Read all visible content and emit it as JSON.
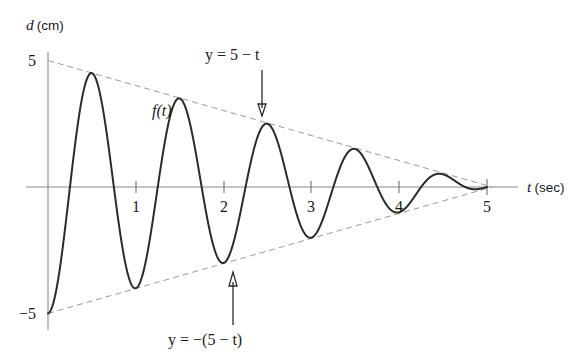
{
  "chart_data": {
    "type": "line",
    "title": "",
    "xlabel": "t (sec)",
    "ylabel": "d (cm)",
    "xlabel_symbol": "t",
    "xlabel_unit": "(sec)",
    "ylabel_symbol": "d",
    "ylabel_unit": "(cm)",
    "xlim": [
      0,
      5.35
    ],
    "ylim": [
      -5.6,
      5.4
    ],
    "grid": false,
    "legend": "none",
    "x_ticks": [
      1,
      2,
      3,
      4,
      5
    ],
    "x_tick_labels": [
      "1",
      "2",
      "3",
      "4",
      "5"
    ],
    "y_ticks": [
      5,
      -5
    ],
    "y_tick_labels": [
      "5",
      "-5"
    ],
    "series": [
      {
        "name": "f(t)",
        "label": "f(t)",
        "kind": "damped-oscillation",
        "expression": "f(t) = -(5 - t) * cos(2*pi*t)",
        "style": "solid",
        "color": "#2b2b2b",
        "domain": [
          0,
          5
        ],
        "period": 1,
        "points": [
          {
            "t": 0.0,
            "d": 5.0
          },
          {
            "t": 0.5,
            "d": -4.65
          },
          {
            "t": 1.0,
            "d": 4.15
          },
          {
            "t": 1.5,
            "d": -3.6
          },
          {
            "t": 2.0,
            "d": 3.1
          },
          {
            "t": 2.5,
            "d": -2.6
          },
          {
            "t": 3.0,
            "d": 2.05
          },
          {
            "t": 3.5,
            "d": -1.55
          },
          {
            "t": 4.0,
            "d": 1.05
          },
          {
            "t": 4.5,
            "d": -0.5
          },
          {
            "t": 5.0,
            "d": 0.0
          }
        ]
      },
      {
        "name": "upper-envelope",
        "label": "y = 5 - t",
        "kind": "line",
        "expression": "y = 5 - t",
        "style": "dashed",
        "color": "#9a9a9a",
        "points": [
          {
            "t": 0,
            "d": 5
          },
          {
            "t": 5,
            "d": 0
          }
        ]
      },
      {
        "name": "lower-envelope",
        "label": "y = -(5 - t)",
        "kind": "line",
        "expression": "y = -(5 - t)",
        "style": "dashed",
        "color": "#9a9a9a",
        "points": [
          {
            "t": 0,
            "d": -5
          },
          {
            "t": 5,
            "d": 0
          }
        ]
      }
    ],
    "annotations": [
      {
        "name": "upper-envelope-annotation",
        "text": "y = 5 − t",
        "arrow": "down",
        "points_to": {
          "t": 2.25,
          "d": 2.75
        }
      },
      {
        "name": "lower-envelope-annotation",
        "text": "y = −(5 − t)",
        "arrow": "up",
        "points_to": {
          "t": 2.25,
          "d": -2.75
        }
      },
      {
        "name": "curve-annotation",
        "text": "f(t)",
        "arrow": "none",
        "points_to": {
          "t": 1.25,
          "d": 3.05
        }
      }
    ]
  }
}
